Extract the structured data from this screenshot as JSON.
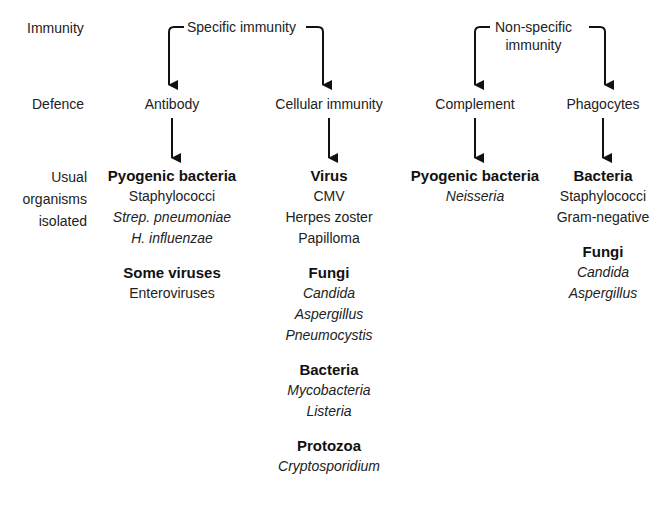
{
  "row_labels": {
    "immunity": "Immunity",
    "defence": "Defence",
    "organisms": [
      "Usual",
      "organisms",
      "isolated"
    ]
  },
  "immunity_types": {
    "specific": "Specific immunity",
    "non_specific_line1": "Non-specific",
    "non_specific_line2": "immunity"
  },
  "defences": {
    "antibody": "Antibody",
    "cellular": "Cellular immunity",
    "complement": "Complement",
    "phagocytes": "Phagocytes"
  },
  "columns": {
    "antibody": [
      {
        "heading": "Pyogenic bacteria",
        "items": [
          {
            "text": "Staphylococci",
            "italic": false
          },
          {
            "text": "Strep. pneumoniae",
            "italic": true
          },
          {
            "text": "H. influenzae",
            "italic": true
          }
        ]
      },
      {
        "heading": "Some viruses",
        "items": [
          {
            "text": "Enteroviruses",
            "italic": false
          }
        ]
      }
    ],
    "cellular": [
      {
        "heading": "Virus",
        "items": [
          {
            "text": "CMV",
            "italic": false
          },
          {
            "text": "Herpes zoster",
            "italic": false
          },
          {
            "text": "Papilloma",
            "italic": false
          }
        ]
      },
      {
        "heading": "Fungi",
        "items": [
          {
            "text": "Candida",
            "italic": true
          },
          {
            "text": "Aspergillus",
            "italic": true
          },
          {
            "text": "Pneumocystis",
            "italic": true
          }
        ]
      },
      {
        "heading": "Bacteria",
        "items": [
          {
            "text": "Mycobacteria",
            "italic": true
          },
          {
            "text": "Listeria",
            "italic": true
          }
        ]
      },
      {
        "heading": "Protozoa",
        "items": [
          {
            "text": "Cryptosporidium",
            "italic": true
          }
        ]
      }
    ],
    "complement": [
      {
        "heading": "Pyogenic bacteria",
        "items": [
          {
            "text": "Neisseria",
            "italic": true
          }
        ]
      }
    ],
    "phagocytes": [
      {
        "heading": "Bacteria",
        "items": [
          {
            "text": "Staphylococci",
            "italic": false
          },
          {
            "text": "Gram-negative",
            "italic": false
          }
        ]
      },
      {
        "heading": "Fungi",
        "items": [
          {
            "text": "Candida",
            "italic": true
          },
          {
            "text": "Aspergillus",
            "italic": true
          }
        ]
      }
    ]
  },
  "colors": {
    "line": "#111111",
    "text": "#222222",
    "background": "#ffffff"
  }
}
